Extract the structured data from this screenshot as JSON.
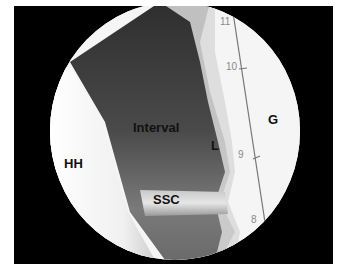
{
  "figure": {
    "type": "arthroscopic-view",
    "labels": {
      "humeral_head": "HH",
      "interval": "Interval",
      "ssc": "SSC",
      "ligament": "L",
      "glenoid": "G"
    },
    "probe_scale": {
      "ticks": [
        "11",
        "10",
        "9",
        "8"
      ]
    },
    "colors": {
      "frame": "#000000",
      "tissue_dark": "#3a3a3a",
      "tissue_mid": "#7a7a7a",
      "bright": "#f4f4f4",
      "tick_text": "#8a8a8a"
    }
  }
}
